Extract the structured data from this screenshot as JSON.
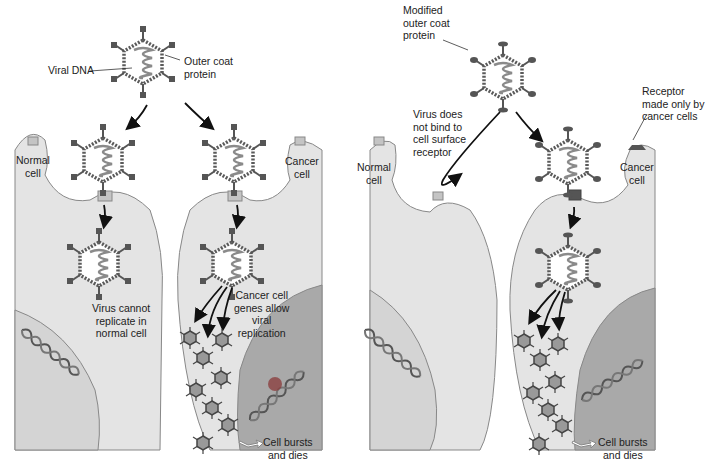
{
  "left_panel": {
    "labels": {
      "viral_dna": "Viral DNA",
      "outer_coat_protein": [
        "Outer coat",
        "protein"
      ],
      "normal_cell": [
        "Normal",
        "cell"
      ],
      "cancer_cell": [
        "Cancer",
        "cell"
      ],
      "virus_cannot_replicate": [
        "Virus cannot",
        "replicate in",
        "normal cell"
      ],
      "cancer_cell_genes": [
        "Cancer cell",
        "genes allow",
        "viral",
        "replication"
      ],
      "cell_bursts": [
        "Cell bursts",
        "and dies"
      ]
    }
  },
  "right_panel": {
    "labels": {
      "modified_outer_coat": [
        "Modified",
        "outer coat",
        "protein"
      ],
      "virus_does_not_bind": [
        "Virus does",
        "not bind to",
        "cell surface",
        "receptor"
      ],
      "receptor_cancer_only": [
        "Receptor",
        "made only by",
        "cancer cells"
      ],
      "normal_cell": [
        "Normal",
        "cell"
      ],
      "cancer_cell": [
        "Cancer",
        "cell"
      ],
      "cell_bursts": [
        "Cell bursts",
        "and dies"
      ]
    }
  },
  "colors": {
    "cytoplasm": "#e4e4e4",
    "nucleus_normal": "#d4d4d4",
    "nucleus_cancer": "#a9a9a9",
    "membrane": "#888888",
    "capsid": "#5a5a5a",
    "dna": "#8a8a8a",
    "receptor": "#c4c4c4",
    "receptor_cancer": "#555555",
    "mutation": "#8a3a3a"
  }
}
